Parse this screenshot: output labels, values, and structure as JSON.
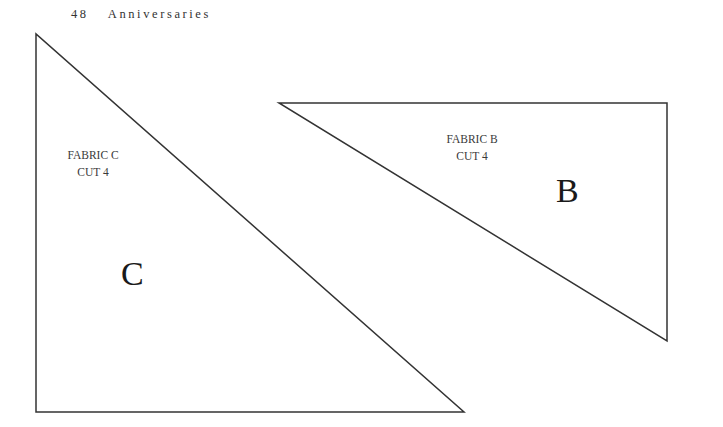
{
  "header": {
    "page_number": "48",
    "section_title": "Anniversaries"
  },
  "pieces": [
    {
      "id": "C",
      "letter": "C",
      "fabric_label": "FABRIC C",
      "cut_label": "CUT 4",
      "points": "36,34 36,412 464,412"
    },
    {
      "id": "B",
      "letter": "B",
      "fabric_label": "FABRIC B",
      "cut_label": "CUT 4",
      "points": "279,103 667,103 667,341"
    }
  ],
  "colors": {
    "outline": "#333333",
    "background": "#ffffff"
  }
}
